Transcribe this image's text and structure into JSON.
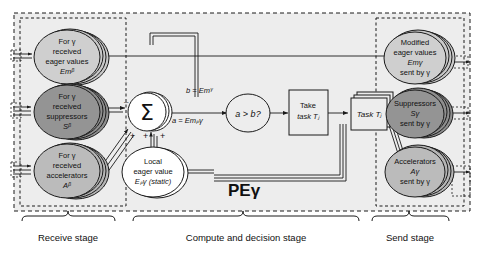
{
  "diagram": {
    "title_label": "PEγ",
    "receive": {
      "items": [
        {
          "id": "eager-values",
          "lines": [
            "For γ",
            "received",
            "eager values",
            "Emᵝ"
          ],
          "fill": "#c9c9c9"
        },
        {
          "id": "suppressors",
          "lines": [
            "For γ",
            "received",
            "suppressors",
            "Sᵝ"
          ],
          "fill": "#8e8e8e"
        },
        {
          "id": "accelerators",
          "lines": [
            "For γ",
            "received",
            "accelerators",
            "Aᵝ"
          ],
          "fill": "#b5b5b5"
        }
      ]
    },
    "compute": {
      "sum_symbol": "Σ",
      "sign_minus": "–",
      "sign_plus_left": "+",
      "sign_plus_mid": "+",
      "sign_plus_right": "+",
      "local": {
        "lines": [
          "Local",
          "eager value",
          "Eₚγ (static)"
        ]
      },
      "label_b": "b = Emᵞ",
      "label_a": "a = Emₚγ",
      "compare": "a > b?",
      "take_task": [
        "Take",
        "task Tⱼ"
      ],
      "task": "Task Tⱼ"
    },
    "send": {
      "items": [
        {
          "id": "modified-eager-values",
          "lines": [
            "Modified",
            "eager values",
            "Emγ",
            "sent by γ"
          ],
          "fill": "#c9c9c9"
        },
        {
          "id": "suppressors-sent",
          "lines": [
            "Suppressors",
            "Sγ",
            "sent by γ"
          ],
          "fill": "#8e8e8e"
        },
        {
          "id": "accelerators-sent",
          "lines": [
            "Accelerators",
            "Aγ",
            "sent by γ"
          ],
          "fill": "#b5b5b5"
        }
      ]
    },
    "stages": [
      {
        "id": "receive-stage",
        "label": "Receive stage"
      },
      {
        "id": "compute-stage",
        "label": "Compute and decision stage"
      },
      {
        "id": "send-stage",
        "label": "Send stage"
      }
    ],
    "colors": {
      "panel": "#eeeeee",
      "stroke": "#1a1a1a",
      "light": "#c9c9c9",
      "mid": "#b5b5b5",
      "dark": "#8e8e8e",
      "white": "#ffffff"
    }
  }
}
